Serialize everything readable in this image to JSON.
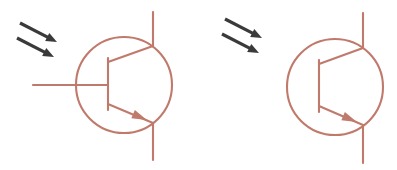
{
  "image": {
    "title": "Phototransistor circuit symbols",
    "width": 397,
    "height": 170,
    "background_color": "#ffffff"
  },
  "palette": {
    "symbol_stroke": "#c07a6b",
    "symbol_stroke_light": "#cf9183",
    "light_arrow_color": "#3a3a3a",
    "background": "#ffffff"
  },
  "style": {
    "symbol_stroke_width": 2.1,
    "light_arrow_shaft_width": 3.2
  },
  "symbols": [
    {
      "name": "phototransistor-with-base-lead",
      "device_type": "NPN phototransistor",
      "has_base_lead": true,
      "circle": {
        "cx": 124,
        "cy": 85,
        "r": 48
      },
      "base_bar": {
        "x": 108,
        "y1": 58,
        "y2": 110
      },
      "base_lead": {
        "x1": 33,
        "x2": 108,
        "y": 85
      },
      "collector_diagonal": {
        "x1": 108,
        "y1": 62,
        "x2": 153,
        "y2": 46
      },
      "collector_lead": {
        "x": 153,
        "y1": 12,
        "y2": 46
      },
      "emitter_diagonal": {
        "x1": 108,
        "y1": 104,
        "x2": 153,
        "y2": 123
      },
      "emitter_lead": {
        "x": 153,
        "y1": 123,
        "y2": 160
      },
      "emitter_arrowhead": {
        "cx": 140,
        "cy": 117,
        "angle_deg": 23,
        "length": 15,
        "width": 9
      },
      "light_arrows": [
        {
          "x1": 20,
          "y1": 23,
          "x2": 57,
          "y2": 42
        },
        {
          "x1": 17,
          "y1": 38,
          "x2": 54,
          "y2": 57
        }
      ]
    },
    {
      "name": "phototransistor-no-base-lead",
      "device_type": "NPN phototransistor",
      "has_base_lead": false,
      "circle": {
        "cx": 335,
        "cy": 87,
        "r": 48
      },
      "base_bar": {
        "x": 319,
        "y1": 60,
        "y2": 112
      },
      "base_lead": null,
      "collector_diagonal": {
        "x1": 319,
        "y1": 64,
        "x2": 363,
        "y2": 48
      },
      "collector_lead": {
        "x": 363,
        "y1": 13,
        "y2": 48
      },
      "emitter_diagonal": {
        "x1": 319,
        "y1": 106,
        "x2": 363,
        "y2": 125
      },
      "emitter_lead": {
        "x": 363,
        "y1": 125,
        "y2": 163
      },
      "emitter_arrowhead": {
        "cx": 350,
        "cy": 119,
        "angle_deg": 23,
        "length": 15,
        "width": 9
      },
      "light_arrows": [
        {
          "x1": 225,
          "y1": 19,
          "x2": 262,
          "y2": 38
        },
        {
          "x1": 222,
          "y1": 34,
          "x2": 259,
          "y2": 53
        }
      ]
    }
  ]
}
